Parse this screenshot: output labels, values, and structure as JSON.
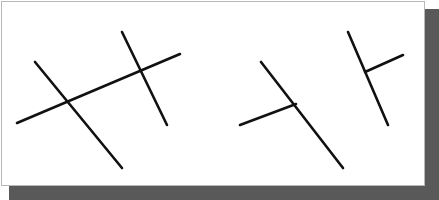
{
  "figure": {
    "canvas": {
      "width": 439,
      "height": 200
    },
    "panel": {
      "name": "white-card",
      "background_color": "#ffffff",
      "border_color": "#b8b8b8",
      "shadow_color": "#595959",
      "x": 1,
      "y": 1,
      "width": 424,
      "height": 185
    },
    "stroke": {
      "color": "#111111",
      "width": 2.6,
      "linecap": "round"
    },
    "groups": [
      {
        "name": "left-x-junction-pair",
        "junction_type": "X",
        "lines": [
          {
            "name": "steep-descending-line",
            "x1": 35,
            "y1": 62,
            "x2": 122,
            "y2": 168,
            "orientation": "steep-down-right"
          },
          {
            "name": "shallow-ascending-line",
            "x1": 17,
            "y1": 123,
            "x2": 180,
            "y2": 54,
            "orientation": "shallow-up-right"
          }
        ]
      },
      {
        "name": "left-inner-x-junction-pair",
        "junction_type": "X",
        "lines": [
          {
            "name": "near-vertical-line",
            "x1": 122,
            "y1": 32,
            "x2": 167,
            "y2": 125,
            "orientation": "near-vertical-down-right"
          }
        ]
      },
      {
        "name": "right-t-junction-pair",
        "junction_type": "T",
        "lines": [
          {
            "name": "steep-descending-line",
            "x1": 261,
            "y1": 62,
            "x2": 343,
            "y2": 168,
            "orientation": "steep-down-right"
          },
          {
            "name": "shallow-ascending-stub",
            "x1": 240,
            "y1": 125,
            "x2": 296,
            "y2": 104,
            "orientation": "shallow-up-right"
          }
        ]
      },
      {
        "name": "far-right-t-junction-pair",
        "junction_type": "T",
        "lines": [
          {
            "name": "steep-descending-line",
            "x1": 348,
            "y1": 32,
            "x2": 388,
            "y2": 125,
            "orientation": "steep-down-right"
          },
          {
            "name": "shallow-ascending-stub",
            "x1": 365,
            "y1": 72,
            "x2": 403,
            "y2": 55,
            "orientation": "shallow-up-right"
          }
        ]
      }
    ]
  }
}
